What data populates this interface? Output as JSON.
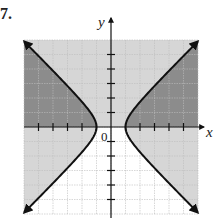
{
  "problem": {
    "label": "7."
  },
  "chart_data": {
    "type": "region-graph",
    "title": "",
    "xlabel": "x",
    "ylabel": "y",
    "origin_label": "0",
    "xlim": [
      -6,
      6
    ],
    "ylim": [
      -6,
      6
    ],
    "grid": true,
    "ticks": {
      "x": [
        -5,
        -4,
        -3,
        -2,
        -1,
        1,
        2,
        3,
        4,
        5
      ],
      "y": [
        -5,
        -4,
        -3,
        -2,
        -1,
        1,
        2,
        3,
        4,
        5
      ]
    },
    "curves": [
      {
        "name": "hyperbola",
        "equation": "x^2 - y^2 = 1",
        "vertices": [
          [
            -1,
            0
          ],
          [
            1,
            0
          ]
        ],
        "asymptotes": [
          "y = x",
          "y = -x"
        ],
        "style": "solid",
        "arrows": true
      }
    ],
    "boundaries": [
      {
        "name": "x-axis",
        "equation": "y = 0",
        "style": "solid"
      }
    ],
    "regions": [
      {
        "name": "y >= 0",
        "shade": "light"
      },
      {
        "name": "x^2 - y^2 >= 1",
        "shade": "light"
      },
      {
        "name": "solution (overlap)",
        "shade": "dark"
      }
    ],
    "colors": {
      "light_shade": "#d6d6d6",
      "dark_shade": "#8c8c8c",
      "grid": "#bdbdbd",
      "curve": "#111111",
      "background": "#ffffff"
    }
  }
}
